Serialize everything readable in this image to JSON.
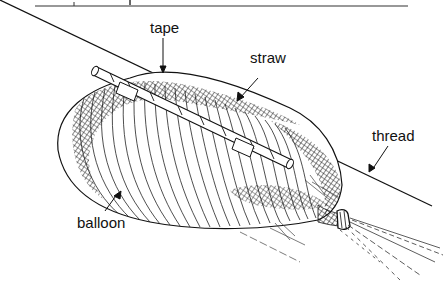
{
  "figure": {
    "colors": {
      "ink": "#111111",
      "background": "#ffffff",
      "hatch": "#222222"
    },
    "labels": [
      {
        "id": "tape",
        "text": "tape",
        "x": 150,
        "y": 20
      },
      {
        "id": "straw",
        "text": "straw",
        "x": 250,
        "y": 50
      },
      {
        "id": "thread",
        "text": "thread",
        "x": 372,
        "y": 128
      },
      {
        "id": "balloon",
        "text": "balloon",
        "x": 77,
        "y": 215
      }
    ]
  }
}
